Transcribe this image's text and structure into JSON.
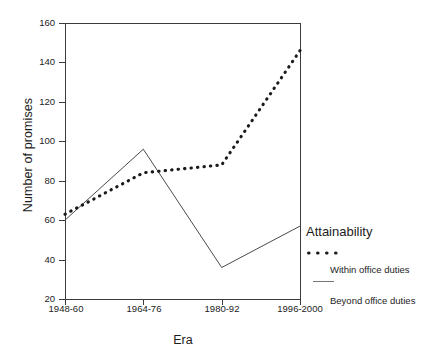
{
  "chart_data": {
    "type": "line",
    "title": "",
    "xlabel": "Era",
    "ylabel": "Number of promises",
    "categories": [
      "1948-60",
      "1964-76",
      "1980-92",
      "1996-2000"
    ],
    "ylim": [
      20,
      160
    ],
    "yticks": [
      20,
      40,
      60,
      80,
      100,
      120,
      140,
      160
    ],
    "grid": false,
    "legend_position": "right",
    "legend_title": "Attainability",
    "series": [
      {
        "name": "Within office duties",
        "style": "dotted",
        "values": [
          63,
          84,
          88,
          146
        ]
      },
      {
        "name": "Beyond office duties",
        "style": "solid",
        "values": [
          60,
          96,
          36,
          57
        ]
      }
    ]
  },
  "axes": {
    "y_title": "Number of promises",
    "x_title": "Era",
    "y_ticks": [
      "160",
      "140",
      "120",
      "100",
      "80",
      "60",
      "40",
      "20"
    ],
    "x_ticks": [
      "1948-60",
      "1964-76",
      "1980-92",
      "1996-2000"
    ]
  },
  "legend": {
    "title": "Attainability",
    "items": [
      {
        "label": "Within office duties",
        "style": "dotted"
      },
      {
        "label": "Beyond office duties",
        "style": "solid"
      }
    ]
  },
  "colors": {
    "ink": "#1c1c1c",
    "axis": "#3b3b3b",
    "series_dotted": "#1a1a1a",
    "series_solid": "#4a4a4a",
    "background": "#ffffff"
  }
}
